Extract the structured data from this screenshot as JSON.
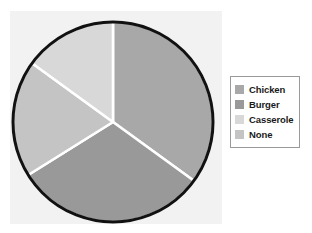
{
  "chart_data": {
    "type": "pie",
    "title": "",
    "categories": [
      "Chicken",
      "Burger",
      "Casserole",
      "None"
    ],
    "values": [
      35,
      31,
      15,
      19
    ],
    "units": "percent",
    "start_angle_deg": 0,
    "direction": "clockwise",
    "colors": [
      "#a8a8a8",
      "#999999",
      "#d8d8d8",
      "#c4c4c4"
    ],
    "slice_separator_color": "#ffffff",
    "outline_color": "#111111",
    "legend_position": "right",
    "grid": false,
    "xlabel": "",
    "ylabel": "",
    "slices": [
      {
        "label": "Chicken",
        "value": 35,
        "color": "#a8a8a8",
        "start_deg": 0,
        "end_deg": 126
      },
      {
        "label": "Burger",
        "value": 31,
        "color": "#999999",
        "start_deg": 126,
        "end_deg": 238
      },
      {
        "label": "None",
        "value": 19,
        "color": "#c4c4c4",
        "start_deg": 238,
        "end_deg": 306
      },
      {
        "label": "Casserole",
        "value": 15,
        "color": "#d8d8d8",
        "start_deg": 306,
        "end_deg": 360
      }
    ]
  },
  "chart": {
    "panel_background": "#f2f2f2",
    "page_background": "#ffffff"
  },
  "legend": {
    "border_color": "#9a9a9a",
    "background": "#ffffff",
    "items": [
      {
        "label": "Chicken",
        "color": "#a8a8a8"
      },
      {
        "label": "Burger",
        "color": "#999999"
      },
      {
        "label": "Casserole",
        "color": "#d8d8d8"
      },
      {
        "label": "None",
        "color": "#c4c4c4"
      }
    ]
  }
}
